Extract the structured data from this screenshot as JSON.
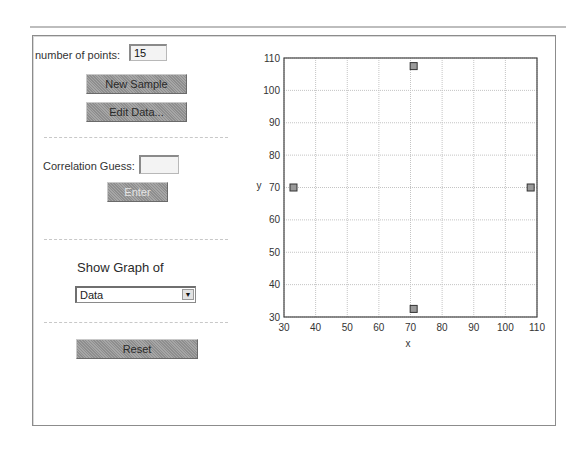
{
  "controls": {
    "num_points_label": "number of points:",
    "num_points_value": "15",
    "new_sample_label": "New Sample",
    "edit_data_label": "Edit Data...",
    "correlation_label": "Correlation Guess:",
    "correlation_value": "",
    "enter_label": "Enter",
    "show_graph_label": "Show Graph of",
    "show_graph_selected": "Data",
    "reset_label": "Reset"
  },
  "chart_data": {
    "type": "scatter",
    "title": "",
    "xlabel": "x",
    "ylabel": "y",
    "xlim": [
      30,
      110
    ],
    "ylim": [
      30,
      110
    ],
    "xticks": [
      30,
      40,
      50,
      60,
      70,
      80,
      90,
      100,
      110
    ],
    "yticks": [
      30,
      40,
      50,
      60,
      70,
      80,
      90,
      100,
      110
    ],
    "grid": true,
    "marker": "square",
    "marker_color": "#9a9a9a",
    "points": [
      {
        "x": 33,
        "y": 70
      },
      {
        "x": 71,
        "y": 107.5
      },
      {
        "x": 108,
        "y": 70
      },
      {
        "x": 71,
        "y": 32.5
      }
    ]
  }
}
